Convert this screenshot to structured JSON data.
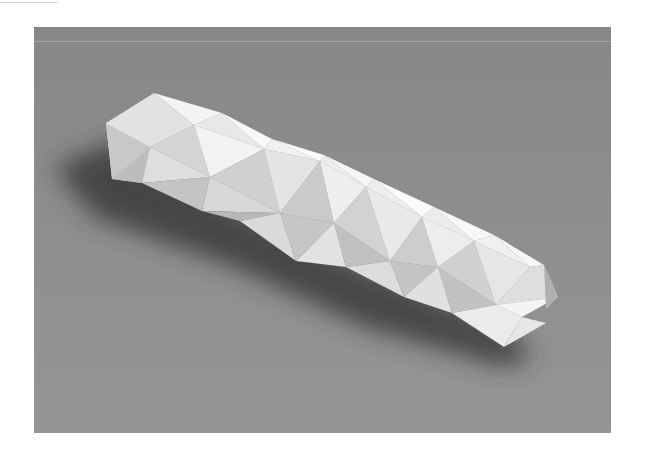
{
  "image": {
    "subject": "folded white paper origami tube with triangular faceted pattern",
    "background_color": "#8b8b8b",
    "paper_color": "#f2f2f2",
    "shadow_color": "#3a3a3a"
  }
}
